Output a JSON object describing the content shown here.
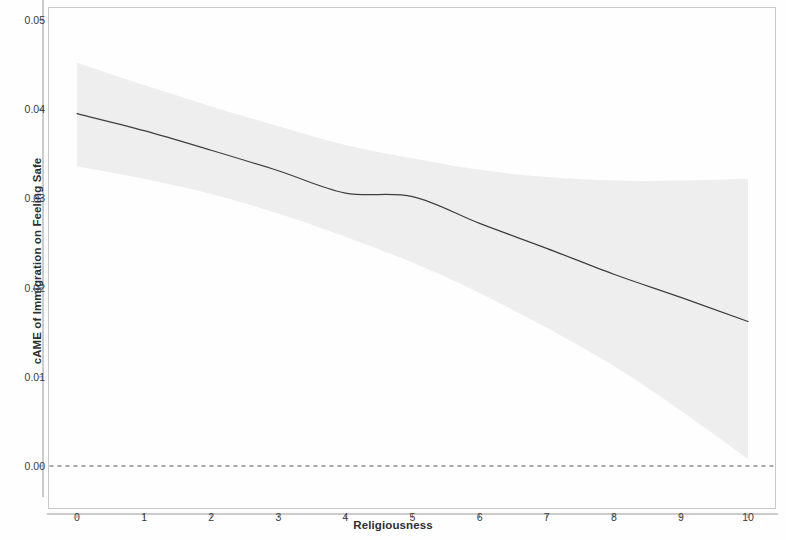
{
  "chart_data": {
    "type": "line",
    "title": "",
    "subtitle": "",
    "xlabel": "Religiousness",
    "ylabel": "cAME of Immigration on Feeling Safe",
    "xlim": [
      -0.45,
      10.45
    ],
    "ylim": [
      -0.0035,
      0.0525
    ],
    "xticks": [
      0,
      1,
      2,
      3,
      4,
      5,
      6,
      7,
      8,
      9,
      10
    ],
    "xtick_labels": [
      "0",
      "1",
      "2",
      "3",
      "4",
      "5",
      "6",
      "7",
      "8",
      "9",
      "10"
    ],
    "yticks": [
      0.0,
      0.01,
      0.02,
      0.03,
      0.04,
      0.05
    ],
    "ytick_labels": [
      "0.00",
      "0.01",
      "0.02",
      "0.03",
      "0.04",
      "0.05"
    ],
    "grid": false,
    "legend": "none",
    "x": [
      0,
      1,
      2,
      3,
      4,
      5,
      6,
      7,
      8,
      9,
      10
    ],
    "series": [
      {
        "name": "cAME estimate",
        "type": "line",
        "color": "#3f3f3f",
        "linewidth": 1.2,
        "values": [
          0.0395,
          0.0376,
          0.0354,
          0.0331,
          0.0306,
          0.0302,
          0.0272,
          0.0244,
          0.0215,
          0.0189,
          0.0162
        ]
      },
      {
        "name": "confidence interval upper",
        "type": "band-upper",
        "color": "#ededed",
        "values": [
          0.0452,
          0.0427,
          0.0403,
          0.0381,
          0.036,
          0.0345,
          0.0332,
          0.0324,
          0.032,
          0.032,
          0.0322
        ]
      },
      {
        "name": "confidence interval lower",
        "type": "band-lower",
        "color": "#ededed",
        "values": [
          0.0336,
          0.0322,
          0.0305,
          0.0283,
          0.0257,
          0.0228,
          0.0194,
          0.0155,
          0.0112,
          0.0062,
          0.0008
        ]
      },
      {
        "name": "zero reference line",
        "type": "hline-dashed",
        "color": "#5a5a5a",
        "value": 0.0
      }
    ],
    "annotations": []
  },
  "figure": {
    "panel_border_color": "#c8c8c8",
    "background": "#ffffff",
    "axis_color": "#9a9a9a",
    "band_color": "#ededed",
    "line_color": "#3f3f3f",
    "zero_line_color": "#5a5a5a"
  }
}
